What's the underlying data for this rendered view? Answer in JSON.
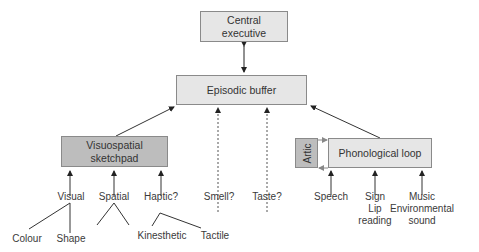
{
  "diagram": {
    "nodes": {
      "central_executive": "Central\nexecutive",
      "central_executive_l1": "Central",
      "central_executive_l2": "executive",
      "episodic_buffer": "Episodic buffer",
      "visuospatial_l1": "Visuospatial",
      "visuospatial_l2": "sketchpad",
      "artic": "Artic",
      "phonological_loop": "Phonological loop"
    },
    "inputs": {
      "visual": "Visual",
      "spatial": "Spatial",
      "haptic": "Haptic?",
      "smell": "Smell?",
      "taste": "Taste?",
      "speech": "Speech",
      "sign": "Sign",
      "lip": "Lip",
      "reading": "reading",
      "music": "Music",
      "environmental": "Environmental",
      "sound": "sound"
    },
    "sub_inputs": {
      "colour": "Colour",
      "shape": "Shape",
      "kinesthetic": "Kinesthetic",
      "tactile": "Tactile"
    },
    "edges": [
      {
        "from": "Central executive",
        "to": "Episodic buffer",
        "type": "bidirectional"
      },
      {
        "from": "Visuospatial sketchpad",
        "to": "Episodic buffer",
        "type": "arrow"
      },
      {
        "from": "Phonological loop",
        "to": "Episodic buffer",
        "type": "arrow"
      },
      {
        "from": "Smell?",
        "to": "Episodic buffer",
        "type": "dashed-arrow"
      },
      {
        "from": "Taste?",
        "to": "Episodic buffer",
        "type": "dashed-arrow"
      },
      {
        "from": "Visual",
        "to": "Visuospatial sketchpad",
        "type": "arrow"
      },
      {
        "from": "Spatial",
        "to": "Visuospatial sketchpad",
        "type": "arrow"
      },
      {
        "from": "Haptic?",
        "to": "Visuospatial sketchpad",
        "type": "arrow"
      },
      {
        "from": "Speech",
        "to": "Phonological loop",
        "type": "arrow"
      },
      {
        "from": "Sign / Lip reading",
        "to": "Phonological loop",
        "type": "arrow"
      },
      {
        "from": "Music / Environmental sound",
        "to": "Phonological loop",
        "type": "arrow"
      },
      {
        "from": "Artic",
        "to": "Phonological loop",
        "type": "loop"
      }
    ],
    "colors": {
      "light_box": "#e6e6e6",
      "dark_box": "#bdbdbd",
      "line": "#333333",
      "border": "#8a8a8a"
    }
  }
}
